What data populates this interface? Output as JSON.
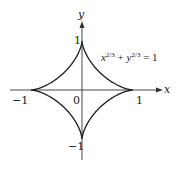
{
  "figure": {
    "equation": {
      "x": "x",
      "x_exp": "2/3",
      "plus": " + ",
      "y": "y",
      "y_exp": "2/3",
      "rhs": " = 1"
    },
    "axes": {
      "x_label": "x",
      "y_label": "y",
      "origin_label": "0",
      "x_pos_tick": "1",
      "x_neg_tick": "−1",
      "y_pos_tick": "1",
      "y_neg_tick": "−1"
    },
    "curve": {
      "name": "astroid",
      "parametric": "x = cos^3 t, y = sin^3 t",
      "stroke_color": "#1a1a1a"
    }
  }
}
